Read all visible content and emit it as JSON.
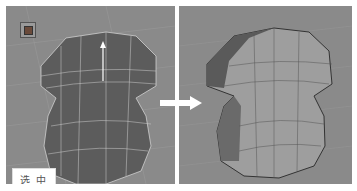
{
  "panels": {
    "left": {
      "state": "wireframe-selected",
      "bg_color": "#8a8a8a"
    },
    "right": {
      "state": "shaded-result",
      "bg_color": "#8a8a8a"
    }
  },
  "label": {
    "text": "选中"
  },
  "arrow": {
    "direction": "right",
    "color": "#ffffff"
  },
  "icons": {
    "view_cube": "cube-icon"
  }
}
